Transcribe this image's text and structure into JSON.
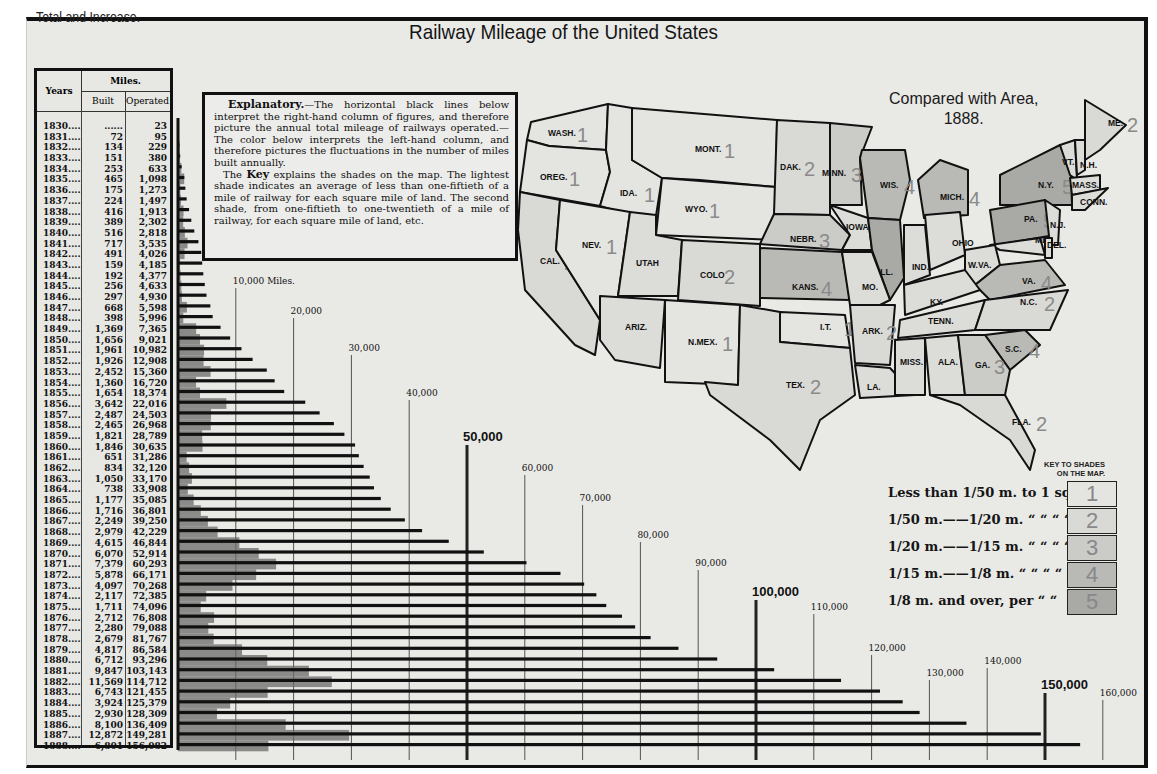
{
  "header": {
    "subtitle": "Total and Increase.",
    "title": "Railway Mileage of the United States"
  },
  "table": {
    "col_years": "Years",
    "col_miles": "Miles.",
    "col_built": "Built",
    "col_operated": "Operated",
    "rows": [
      {
        "year": "1830",
        "built": "......",
        "operated": "23"
      },
      {
        "year": "1831",
        "built": "72",
        "operated": "95"
      },
      {
        "year": "1832",
        "built": "134",
        "operated": "229"
      },
      {
        "year": "1833",
        "built": "151",
        "operated": "380"
      },
      {
        "year": "1834",
        "built": "253",
        "operated": "633"
      },
      {
        "year": "1835",
        "built": "465",
        "operated": "1,098"
      },
      {
        "year": "1836",
        "built": "175",
        "operated": "1,273"
      },
      {
        "year": "1837",
        "built": "224",
        "operated": "1,497"
      },
      {
        "year": "1838",
        "built": "416",
        "operated": "1,913"
      },
      {
        "year": "1839",
        "built": "389",
        "operated": "2,302"
      },
      {
        "year": "1840",
        "built": "516",
        "operated": "2,818"
      },
      {
        "year": "1841",
        "built": "717",
        "operated": "3,535"
      },
      {
        "year": "1842",
        "built": "491",
        "operated": "4,026"
      },
      {
        "year": "1843",
        "built": "159",
        "operated": "4,185"
      },
      {
        "year": "1844",
        "built": "192",
        "operated": "4,377"
      },
      {
        "year": "1845",
        "built": "256",
        "operated": "4,633"
      },
      {
        "year": "1846",
        "built": "297",
        "operated": "4,930"
      },
      {
        "year": "1847",
        "built": "668",
        "operated": "5,598"
      },
      {
        "year": "1848",
        "built": "398",
        "operated": "5,996"
      },
      {
        "year": "1849",
        "built": "1,369",
        "operated": "7,365"
      },
      {
        "year": "1850",
        "built": "1,656",
        "operated": "9,021"
      },
      {
        "year": "1851",
        "built": "1,961",
        "operated": "10,982"
      },
      {
        "year": "1852",
        "built": "1,926",
        "operated": "12,908"
      },
      {
        "year": "1853",
        "built": "2,452",
        "operated": "15,360"
      },
      {
        "year": "1854",
        "built": "1,360",
        "operated": "16,720"
      },
      {
        "year": "1855",
        "built": "1,654",
        "operated": "18,374"
      },
      {
        "year": "1856",
        "built": "3,642",
        "operated": "22,016"
      },
      {
        "year": "1857",
        "built": "2,487",
        "operated": "24,503"
      },
      {
        "year": "1858",
        "built": "2,465",
        "operated": "26,968"
      },
      {
        "year": "1859",
        "built": "1,821",
        "operated": "28,789"
      },
      {
        "year": "1860",
        "built": "1,846",
        "operated": "30,635"
      },
      {
        "year": "1861",
        "built": "651",
        "operated": "31,286"
      },
      {
        "year": "1862",
        "built": "834",
        "operated": "32,120"
      },
      {
        "year": "1863",
        "built": "1,050",
        "operated": "33,170"
      },
      {
        "year": "1864",
        "built": "738",
        "operated": "33,908"
      },
      {
        "year": "1865",
        "built": "1,177",
        "operated": "35,085"
      },
      {
        "year": "1866",
        "built": "1,716",
        "operated": "36,801"
      },
      {
        "year": "1867",
        "built": "2,249",
        "operated": "39,250"
      },
      {
        "year": "1868",
        "built": "2,979",
        "operated": "42,229"
      },
      {
        "year": "1869",
        "built": "4,615",
        "operated": "46,844"
      },
      {
        "year": "1870",
        "built": "6,070",
        "operated": "52,914"
      },
      {
        "year": "1871",
        "built": "7,379",
        "operated": "60,293"
      },
      {
        "year": "1872",
        "built": "5,878",
        "operated": "66,171"
      },
      {
        "year": "1873",
        "built": "4,097",
        "operated": "70,268"
      },
      {
        "year": "1874",
        "built": "2,117",
        "operated": "72,385"
      },
      {
        "year": "1875",
        "built": "1,711",
        "operated": "74,096"
      },
      {
        "year": "1876",
        "built": "2,712",
        "operated": "76,808"
      },
      {
        "year": "1877",
        "built": "2,280",
        "operated": "79,088"
      },
      {
        "year": "1878",
        "built": "2,679",
        "operated": "81,767"
      },
      {
        "year": "1879",
        "built": "4,817",
        "operated": "86,584"
      },
      {
        "year": "1880",
        "built": "6,712",
        "operated": "93,296"
      },
      {
        "year": "1881",
        "built": "9,847",
        "operated": "103,143"
      },
      {
        "year": "1882",
        "built": "11,569",
        "operated": "114,712"
      },
      {
        "year": "1883",
        "built": "6,743",
        "operated": "121,455"
      },
      {
        "year": "1884",
        "built": "3,924",
        "operated": "125,379"
      },
      {
        "year": "1885",
        "built": "2,930",
        "operated": "128,309"
      },
      {
        "year": "1886",
        "built": "8,100",
        "operated": "136,409"
      },
      {
        "year": "1887",
        "built": "12,872",
        "operated": "149,281"
      },
      {
        "year": "1888",
        "built": "6,801",
        "operated": "156,082"
      }
    ]
  },
  "explanatory": {
    "heading": "Explanatory.",
    "para1": "—The horizontal black lines below interpret the right-hand column of figures, and therefore picture the annual total mileage of railways operated.—The color below interprets the left-hand column, and therefore pictures the fluctuations in the number of miles built annually.",
    "para2_pre": "The ",
    "para2_key": "Key",
    "para2_post": " explains the shades on the map. The lightest shade indicates an average of less than one-fiftieth of a mile of railway for each square mile of land. The second shade, from one-fiftieth to one-twentieth of a mile of railway, for each square mile of land, etc."
  },
  "scale": {
    "labels": [
      {
        "value": 10000,
        "text": "10,000 Miles.",
        "major": false
      },
      {
        "value": 20000,
        "text": "20,000",
        "major": false
      },
      {
        "value": 30000,
        "text": "30,000",
        "major": false
      },
      {
        "value": 40000,
        "text": "40,000",
        "major": false
      },
      {
        "value": 50000,
        "text": "50,000",
        "major": true
      },
      {
        "value": 60000,
        "text": "60,000",
        "major": false
      },
      {
        "value": 70000,
        "text": "70,000",
        "major": false
      },
      {
        "value": 80000,
        "text": "80,000",
        "major": false
      },
      {
        "value": 90000,
        "text": "90,000",
        "major": false
      },
      {
        "value": 100000,
        "text": "100,000",
        "major": true
      },
      {
        "value": 110000,
        "text": "110,000",
        "major": false
      },
      {
        "value": 120000,
        "text": "120,000",
        "major": false
      },
      {
        "value": 130000,
        "text": "130,000",
        "major": false
      },
      {
        "value": 140000,
        "text": "140,000",
        "major": false
      },
      {
        "value": 150000,
        "text": "150,000",
        "major": true
      },
      {
        "value": 160000,
        "text": "160,000",
        "major": false
      }
    ]
  },
  "map": {
    "subtitle_line1": "Compared with Area,",
    "subtitle_line2": "1888.",
    "states": [
      {
        "name": "WASH.",
        "shade": 1
      },
      {
        "name": "OREG.",
        "shade": 1
      },
      {
        "name": "IDA.",
        "shade": 1
      },
      {
        "name": "MONT.",
        "shade": 1
      },
      {
        "name": "WYO.",
        "shade": 1
      },
      {
        "name": "DAK.",
        "shade": 2
      },
      {
        "name": "MINN.",
        "shade": 3
      },
      {
        "name": "WIS.",
        "shade": 4
      },
      {
        "name": "MICH.",
        "shade": 4
      },
      {
        "name": "N.Y.",
        "shade": 5
      },
      {
        "name": "VT.",
        "shade": ""
      },
      {
        "name": "N.H.",
        "shade": ""
      },
      {
        "name": "ME.",
        "shade": 2
      },
      {
        "name": "MASS.",
        "shade": ""
      },
      {
        "name": "CONN.",
        "shade": ""
      },
      {
        "name": "CAL.",
        "shade": 2
      },
      {
        "name": "NEV.",
        "shade": 1
      },
      {
        "name": "UTAH",
        "shade": ""
      },
      {
        "name": "COLO",
        "shade": 2
      },
      {
        "name": "NEBR.",
        "shade": 3
      },
      {
        "name": "IOWA",
        "shade": ""
      },
      {
        "name": "ILL.",
        "shade": 5
      },
      {
        "name": "IND.",
        "shade": ""
      },
      {
        "name": "OHIO",
        "shade": ""
      },
      {
        "name": "PA.",
        "shade": 5
      },
      {
        "name": "N.J.",
        "shade": ""
      },
      {
        "name": "MD",
        "shade": ""
      },
      {
        "name": "DEL.",
        "shade": ""
      },
      {
        "name": "W.VA.",
        "shade": ""
      },
      {
        "name": "VA.",
        "shade": 4
      },
      {
        "name": "KANS.",
        "shade": 4
      },
      {
        "name": "MO.",
        "shade": ""
      },
      {
        "name": "KY.",
        "shade": ""
      },
      {
        "name": "ARIZ.",
        "shade": ""
      },
      {
        "name": "N.MEX.",
        "shade": 1
      },
      {
        "name": "I.T.",
        "shade": 1
      },
      {
        "name": "ARK.",
        "shade": 2
      },
      {
        "name": "TENN.",
        "shade": ""
      },
      {
        "name": "N.C.",
        "shade": 2
      },
      {
        "name": "S.C.",
        "shade": 4
      },
      {
        "name": "TEX.",
        "shade": 2
      },
      {
        "name": "LA.",
        "shade": ""
      },
      {
        "name": "MISS.",
        "shade": ""
      },
      {
        "name": "ALA.",
        "shade": ""
      },
      {
        "name": "GA.",
        "shade": 3
      },
      {
        "name": "FLA.",
        "shade": 2
      }
    ]
  },
  "key": {
    "title_line1": "KEY TO SHADES",
    "title_line2": "ON THE MAP.",
    "rows": [
      {
        "label": "Less than 1/50 m. to 1 sq. m.",
        "shade": "1"
      },
      {
        "label": "1/50 m.——1/20 m. “ “ “  “",
        "shade": "2"
      },
      {
        "label": "1/20 m.——1/15 m. “ “ “  “",
        "shade": "3"
      },
      {
        "label": "1/15 m.——1/8  m. “ “ “  “",
        "shade": "4"
      },
      {
        "label": "1/8 m. and over, per  “  “",
        "shade": "5"
      }
    ],
    "colors": [
      "#e4e4e1",
      "#d9d9d6",
      "#cbcbc8",
      "#b9b9b6",
      "#a9a9a6"
    ]
  },
  "chart_data": {
    "type": "bar",
    "title": "Railway Mileage of the United States",
    "subtitle": "Total and Increase.",
    "xlabel": "Miles",
    "ylabel": "Years",
    "orientation": "horizontal",
    "xlim": [
      0,
      160000
    ],
    "grid": true,
    "categories": [
      "1830",
      "1831",
      "1832",
      "1833",
      "1834",
      "1835",
      "1836",
      "1837",
      "1838",
      "1839",
      "1840",
      "1841",
      "1842",
      "1843",
      "1844",
      "1845",
      "1846",
      "1847",
      "1848",
      "1849",
      "1850",
      "1851",
      "1852",
      "1853",
      "1854",
      "1855",
      "1856",
      "1857",
      "1858",
      "1859",
      "1860",
      "1861",
      "1862",
      "1863",
      "1864",
      "1865",
      "1866",
      "1867",
      "1868",
      "1869",
      "1870",
      "1871",
      "1872",
      "1873",
      "1874",
      "1875",
      "1876",
      "1877",
      "1878",
      "1879",
      "1880",
      "1881",
      "1882",
      "1883",
      "1884",
      "1885",
      "1886",
      "1887",
      "1888"
    ],
    "series": [
      {
        "name": "Miles Operated",
        "color": "#111111",
        "values": [
          23,
          95,
          229,
          380,
          633,
          1098,
          1273,
          1497,
          1913,
          2302,
          2818,
          3535,
          4026,
          4185,
          4377,
          4633,
          4930,
          5598,
          5996,
          7365,
          9021,
          10982,
          12908,
          15360,
          16720,
          18374,
          22016,
          24503,
          26968,
          28789,
          30635,
          31286,
          32120,
          33170,
          33908,
          35085,
          36801,
          39250,
          42229,
          46844,
          52914,
          60293,
          66171,
          70268,
          72385,
          74096,
          76808,
          79088,
          81767,
          86584,
          93296,
          103143,
          114712,
          121455,
          125379,
          128309,
          136409,
          149281,
          156082
        ]
      },
      {
        "name": "Miles Built",
        "color": "#5a5a5a",
        "values": [
          0,
          72,
          134,
          151,
          253,
          465,
          175,
          224,
          416,
          389,
          516,
          717,
          491,
          159,
          192,
          256,
          297,
          668,
          398,
          1369,
          1656,
          1961,
          1926,
          2452,
          1360,
          1654,
          3642,
          2487,
          2465,
          1821,
          1846,
          651,
          834,
          1050,
          738,
          1177,
          1716,
          2249,
          2979,
          4615,
          6070,
          7379,
          5878,
          4097,
          2117,
          1711,
          2712,
          2280,
          2679,
          4817,
          6712,
          9847,
          11569,
          6743,
          3924,
          2930,
          8100,
          12872,
          6801
        ]
      }
    ],
    "tick_labels": [
      "10,000 Miles.",
      "20,000",
      "30,000",
      "40,000",
      "50,000",
      "60,000",
      "70,000",
      "80,000",
      "90,000",
      "100,000",
      "110,000",
      "120,000",
      "130,000",
      "140,000",
      "150,000",
      "160,000"
    ],
    "annotations": [
      "Compared with Area, 1888.",
      "KEY TO SHADES ON THE MAP."
    ]
  }
}
